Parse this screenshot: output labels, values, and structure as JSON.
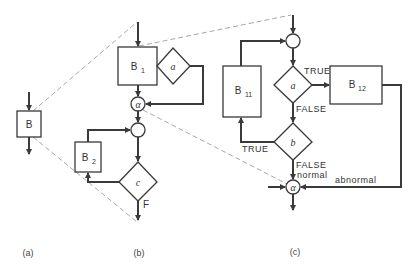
{
  "figure": {
    "panels": [
      {
        "id": "a",
        "caption": "(a)"
      },
      {
        "id": "b",
        "caption": "(b)"
      },
      {
        "id": "c",
        "caption": "(c)"
      }
    ],
    "panel_a": {
      "block": {
        "name": "B"
      }
    },
    "panel_b": {
      "block1": {
        "name": "B",
        "sub": "1"
      },
      "block2": {
        "name": "B",
        "sub": "2"
      },
      "decision_a": "a",
      "decision_c": "c",
      "junction_alpha": "α",
      "exit_label": "F"
    },
    "panel_c": {
      "block11": {
        "name": "B",
        "sub": "11"
      },
      "block12": {
        "name": "B",
        "sub": "12"
      },
      "decision_a": "a",
      "decision_b": "b",
      "junction_alpha": "α",
      "a_true": "TRUE",
      "a_false": "FALSE",
      "b_true": "TRUE",
      "b_false": "FALSE",
      "normal": "normal",
      "abnormal": "abnormal"
    },
    "colors": {
      "line": "#3a3a3a",
      "dashed": "#a8a8a8",
      "background": "#ffffff"
    }
  }
}
